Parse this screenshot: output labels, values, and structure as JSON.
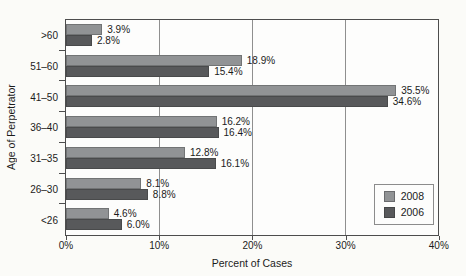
{
  "chart_data": {
    "type": "bar",
    "orientation": "horizontal",
    "title": "",
    "xlabel": "Percent of Cases",
    "ylabel": "Age of Perpetrator",
    "categories": [
      ">60",
      "51–60",
      "41–50",
      "36–40",
      "31–35",
      "26–30",
      "<26"
    ],
    "series": [
      {
        "name": "2008",
        "color": "#919395",
        "values": [
          3.9,
          18.9,
          35.5,
          16.2,
          12.8,
          8.1,
          4.6
        ],
        "labels": [
          "3.9%",
          "18.9%",
          "35.5%",
          "16.2%",
          "12.8%",
          "8.1%",
          "4.6%"
        ]
      },
      {
        "name": "2006",
        "color": "#58595b",
        "values": [
          2.8,
          15.4,
          34.6,
          16.4,
          16.1,
          8.8,
          6.0
        ],
        "labels": [
          "2.8%",
          "15.4%",
          "34.6%",
          "16.4%",
          "16.1%",
          "8.8%",
          "6.0%"
        ]
      }
    ],
    "xlim": [
      0,
      40
    ],
    "x_ticks": [
      {
        "value": 0,
        "label": "0%"
      },
      {
        "value": 10,
        "label": "10%"
      },
      {
        "value": 20,
        "label": "20%"
      },
      {
        "value": 30,
        "label": "30%"
      },
      {
        "value": 40,
        "label": "40%"
      }
    ],
    "gridlines_at": [
      10,
      20,
      30
    ],
    "grid": true,
    "legend": {
      "position": "inside-bottom-right",
      "entries": [
        "2008",
        "2006"
      ]
    }
  },
  "colors": {
    "axis": "#4d4d4d",
    "grid": "#8f8f8f",
    "text": "#1b1b1b",
    "plot_bg": "#fdfdfc",
    "page_bg": "#fbfbf8",
    "legend_border": "#8c8c8c"
  }
}
